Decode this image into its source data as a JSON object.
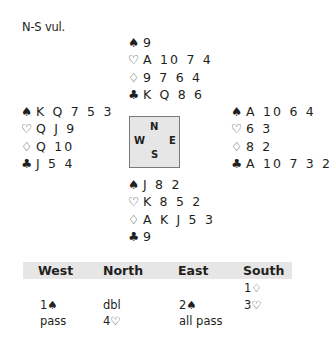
{
  "vulnerability": "N-S vul.",
  "hands": {
    "north": [
      {
        "suit": "♠",
        "cards": "9"
      },
      {
        "suit": "♡",
        "cards": "A 10 7 4"
      },
      {
        "suit": "♢",
        "cards": "9 7 6 4"
      },
      {
        "suit": "♣",
        "cards": "K Q 8 6"
      }
    ],
    "west": [
      {
        "suit": "♠",
        "cards": "K Q 7 5 3"
      },
      {
        "suit": "♡",
        "cards": "Q J 9"
      },
      {
        "suit": "♢",
        "cards": "Q 10"
      },
      {
        "suit": "♣",
        "cards": "J 5 4"
      }
    ],
    "east": [
      {
        "suit": "♠",
        "cards": "A 10 6 4"
      },
      {
        "suit": "♡",
        "cards": "6 3"
      },
      {
        "suit": "♢",
        "cards": "8 2"
      },
      {
        "suit": "♣",
        "cards": "A 10 7 3 2"
      }
    ],
    "south": [
      {
        "suit": "♠",
        "cards": "J 8 2"
      },
      {
        "suit": "♡",
        "cards": "K 8 5 2"
      },
      {
        "suit": "♢",
        "cards": "A K J 5 3"
      },
      {
        "suit": "♣",
        "cards": "9"
      }
    ]
  },
  "compass": {
    "n": "N",
    "s": "S",
    "w": "W",
    "e": "E"
  },
  "auction": {
    "headers": [
      "West",
      "North",
      "East",
      "South"
    ],
    "rows": [
      [
        "",
        "",
        "",
        "1♢"
      ],
      [
        "1♠",
        "dbl",
        "2♠",
        "3♡"
      ],
      [
        "pass",
        "4♡",
        "all pass",
        ""
      ]
    ]
  }
}
